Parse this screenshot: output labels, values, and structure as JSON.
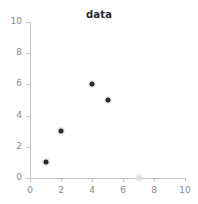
{
  "chart_data": {
    "type": "scatter",
    "title": "data",
    "xlabel": "",
    "ylabel": "",
    "xlim": [
      0,
      10
    ],
    "ylim": [
      0,
      10
    ],
    "xticks": [
      0,
      2,
      4,
      6,
      8,
      10
    ],
    "yticks": [
      0,
      2,
      4,
      6,
      8,
      10
    ],
    "xticklabels": [
      "0",
      "2",
      "4",
      "6",
      "8",
      "10"
    ],
    "yticklabels": [
      "0",
      "2",
      "4",
      "6",
      "8",
      "10"
    ],
    "grid": false,
    "legend": null,
    "series": [
      {
        "name": "data",
        "marker_color": "#2b2b2b",
        "points": [
          {
            "x": 1,
            "y": 1,
            "emphasis": "dark"
          },
          {
            "x": 2,
            "y": 3,
            "emphasis": "dark"
          },
          {
            "x": 4,
            "y": 6,
            "emphasis": "dark"
          },
          {
            "x": 5,
            "y": 5,
            "emphasis": "dark"
          },
          {
            "x": 7,
            "y": 0,
            "emphasis": "faint"
          }
        ]
      }
    ],
    "colors": {
      "marker_dark": "#2b2b2b",
      "marker_faint": "#dedede",
      "axis": "#c4c4c4",
      "ticklabel": "#8a8a8a",
      "title": "#2a2a2a",
      "background": "#ffffff"
    }
  }
}
